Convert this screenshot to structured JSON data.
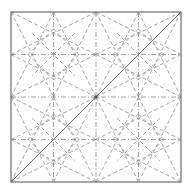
{
  "diagram": {
    "type": "origami-crease-pattern",
    "square": {
      "x": 11,
      "y": 12,
      "size": 170
    },
    "colors": {
      "border": "#6e6e6e",
      "crease": "#8a8a8a",
      "solid": "#6a6a6a",
      "background": "#ffffff"
    },
    "grid_lines": {
      "positions": [
        0.25,
        0.5,
        0.75
      ],
      "style": "dash-dot"
    },
    "solid_diagonal": {
      "from": [
        0,
        1
      ],
      "to": [
        1,
        0
      ]
    },
    "quadrant_pattern": "corner-to-opposite-midpoint star with inner diamond"
  }
}
